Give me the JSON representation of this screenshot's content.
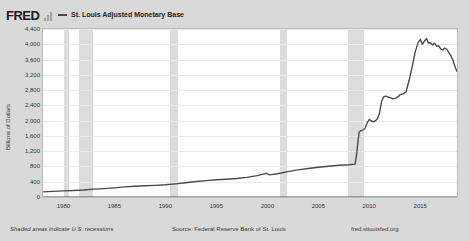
{
  "header": {
    "logo_text": "FRED",
    "logo_icon": "bar-chart-icon",
    "legend": {
      "swatch_color": "#4b4b4b",
      "label": "St. Louis Adjusted Monetary Base"
    }
  },
  "footer": {
    "recession_note": "Shaded areas indicate U.S. recessions",
    "source": "Source: Federal Reserve Bank of St. Louis",
    "url": "fred.stlouisfed.org"
  },
  "chart_data": {
    "type": "line",
    "title": "St. Louis Adjusted Monetary Base",
    "xlabel": "",
    "ylabel": "Billions of Dollars",
    "xlim": [
      1978.0,
      2018.6
    ],
    "ylim": [
      0,
      4400
    ],
    "grid": true,
    "legend_position": "top",
    "line_color": "#4b4b4b",
    "recession_band_color": "#dcdcdc",
    "plot_background": "#ffffff",
    "panel_background": "#d9d9d9",
    "yticks": [
      0,
      400,
      800,
      1200,
      1600,
      2000,
      2400,
      2800,
      3200,
      3600,
      4000,
      4400
    ],
    "ytick_labels": [
      "0",
      "400",
      "800",
      "1,200",
      "1,600",
      "2,000",
      "2,400",
      "2,800",
      "3,200",
      "3,600",
      "4,000",
      "4,400"
    ],
    "xticks": [
      1980,
      1985,
      1990,
      1995,
      2000,
      2005,
      2010,
      2015
    ],
    "xtick_labels": [
      "1980",
      "1985",
      "1990",
      "1995",
      "2000",
      "2005",
      "2010",
      "2015"
    ],
    "recessions": [
      {
        "start": 1980.05,
        "end": 1980.6
      },
      {
        "start": 1981.5,
        "end": 1982.9
      },
      {
        "start": 1990.5,
        "end": 1991.2
      },
      {
        "start": 2001.2,
        "end": 2001.9
      },
      {
        "start": 2007.95,
        "end": 2009.5
      }
    ],
    "series": [
      {
        "name": "St. Louis Adjusted Monetary Base",
        "x": [
          1978.0,
          1979.0,
          1980.0,
          1981.0,
          1982.0,
          1983.0,
          1984.0,
          1985.0,
          1986.0,
          1987.0,
          1988.0,
          1989.0,
          1990.0,
          1991.0,
          1992.0,
          1993.0,
          1994.0,
          1995.0,
          1996.0,
          1997.0,
          1998.0,
          1999.0,
          1999.9,
          2000.2,
          2001.0,
          2002.0,
          2003.0,
          2004.0,
          2005.0,
          2006.0,
          2007.0,
          2008.0,
          2008.6,
          2008.75,
          2008.9,
          2009.0,
          2009.2,
          2009.4,
          2009.6,
          2009.8,
          2010.0,
          2010.2,
          2010.4,
          2010.6,
          2010.8,
          2011.0,
          2011.2,
          2011.4,
          2011.6,
          2011.8,
          2012.0,
          2012.3,
          2012.6,
          2012.9,
          2013.0,
          2013.3,
          2013.6,
          2013.9,
          2014.2,
          2014.5,
          2014.8,
          2015.0,
          2015.2,
          2015.4,
          2015.6,
          2015.8,
          2016.0,
          2016.2,
          2016.4,
          2016.6,
          2016.8,
          2017.0,
          2017.2,
          2017.4,
          2017.6,
          2017.8,
          2018.0,
          2018.2,
          2018.4,
          2018.6
        ],
        "y": [
          135,
          148,
          160,
          172,
          185,
          205,
          220,
          240,
          265,
          280,
          295,
          305,
          320,
          345,
          375,
          405,
          430,
          450,
          465,
          485,
          515,
          560,
          620,
          580,
          610,
          665,
          710,
          745,
          780,
          805,
          830,
          845,
          860,
          1100,
          1480,
          1700,
          1740,
          1760,
          1800,
          1950,
          2030,
          1990,
          1970,
          2000,
          2050,
          2200,
          2500,
          2620,
          2640,
          2620,
          2610,
          2570,
          2590,
          2640,
          2680,
          2700,
          2750,
          3050,
          3400,
          3800,
          4050,
          4130,
          4000,
          4080,
          4150,
          4030,
          4040,
          3980,
          4030,
          3950,
          3960,
          3880,
          3850,
          3900,
          3870,
          3780,
          3700,
          3580,
          3420,
          3280
        ]
      }
    ]
  }
}
